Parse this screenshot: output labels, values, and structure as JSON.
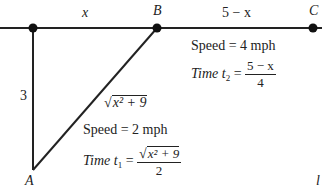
{
  "diagram": {
    "points": {
      "A": "A",
      "B": "B",
      "C": "C"
    },
    "segments": {
      "top_left_label": "x",
      "top_right_label": "5 − x",
      "vertical_label": "3",
      "hypotenuse_label": "x² + 9"
    },
    "right_info": {
      "speed": "Speed = 4 mph",
      "time_prefix": "Time t",
      "time_sub": "2",
      "time_num": "5 − x",
      "time_den": "4"
    },
    "left_info": {
      "speed": "Speed = 2 mph",
      "time_prefix": "Time t",
      "time_sub": "1",
      "time_num": "x² + 9",
      "time_den": "2"
    },
    "corner_mark": "l"
  }
}
